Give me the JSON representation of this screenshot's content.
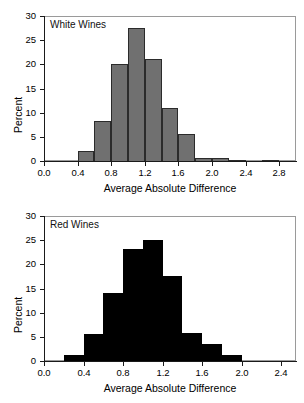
{
  "figure": {
    "panel_count": 2
  },
  "chart_data": [
    {
      "type": "bar",
      "title": "White Wines",
      "panel_label": "White Wines",
      "xlabel": "Average Absolute Difference",
      "ylabel": "Percent",
      "xlim": [
        0.0,
        3.0
      ],
      "ylim": [
        0,
        30
      ],
      "grid": false,
      "legend": null,
      "bin_width": 0.2,
      "fill_color": "#707070",
      "edge_color": "#2b2b2b",
      "xticks": [
        "0.0",
        "0.4",
        "0.8",
        "1.2",
        "1.6",
        "2.0",
        "2.4",
        "2.8"
      ],
      "xtick_values": [
        0.0,
        0.4,
        0.8,
        1.2,
        1.6,
        2.0,
        2.4,
        2.8
      ],
      "yticks": [
        "0",
        "5",
        "10",
        "15",
        "20",
        "25",
        "30"
      ],
      "ytick_values": [
        0,
        5,
        10,
        15,
        20,
        25,
        30
      ],
      "bin_starts": [
        0.4,
        0.6,
        0.8,
        1.0,
        1.2,
        1.4,
        1.6,
        1.8,
        2.0,
        2.2,
        2.6
      ],
      "categories": [
        "0.4-0.6",
        "0.6-0.8",
        "0.8-1.0",
        "1.0-1.2",
        "1.2-1.4",
        "1.4-1.6",
        "1.6-1.8",
        "1.8-2.0",
        "2.0-2.2",
        "2.2-2.4",
        "2.6-2.8"
      ],
      "values": [
        2.2,
        8.4,
        20.2,
        27.8,
        21.3,
        11.1,
        5.7,
        0.9,
        0.8,
        0.2,
        0.2
      ]
    },
    {
      "type": "bar",
      "title": "Red Wines",
      "panel_label": "Red Wines",
      "xlabel": "Average Absolute Difference",
      "ylabel": "Percent",
      "xlim": [
        0.0,
        2.55
      ],
      "ylim": [
        0,
        30
      ],
      "grid": false,
      "legend": null,
      "bin_width": 0.2,
      "fill_color": "#000000",
      "edge_color": "#000000",
      "xticks": [
        "0.0",
        "0.4",
        "0.8",
        "1.2",
        "1.6",
        "2.0",
        "2.4"
      ],
      "xtick_values": [
        0.0,
        0.4,
        0.8,
        1.2,
        1.6,
        2.0,
        2.4
      ],
      "yticks": [
        "0",
        "5",
        "10",
        "15",
        "20",
        "25",
        "30"
      ],
      "ytick_values": [
        0,
        5,
        10,
        15,
        20,
        25,
        30
      ],
      "bin_starts": [
        0.2,
        0.4,
        0.6,
        0.8,
        1.0,
        1.2,
        1.4,
        1.6,
        1.8,
        2.0
      ],
      "categories": [
        "0.2-0.4",
        "0.4-0.6",
        "0.6-0.8",
        "0.8-1.0",
        "1.0-1.2",
        "1.2-1.4",
        "1.4-1.6",
        "1.6-1.8",
        "1.8-2.0",
        "2.0-2.2"
      ],
      "values": [
        1.4,
        5.7,
        14.2,
        23.3,
        25.2,
        17.7,
        5.9,
        3.7,
        1.5,
        0.2
      ]
    }
  ]
}
